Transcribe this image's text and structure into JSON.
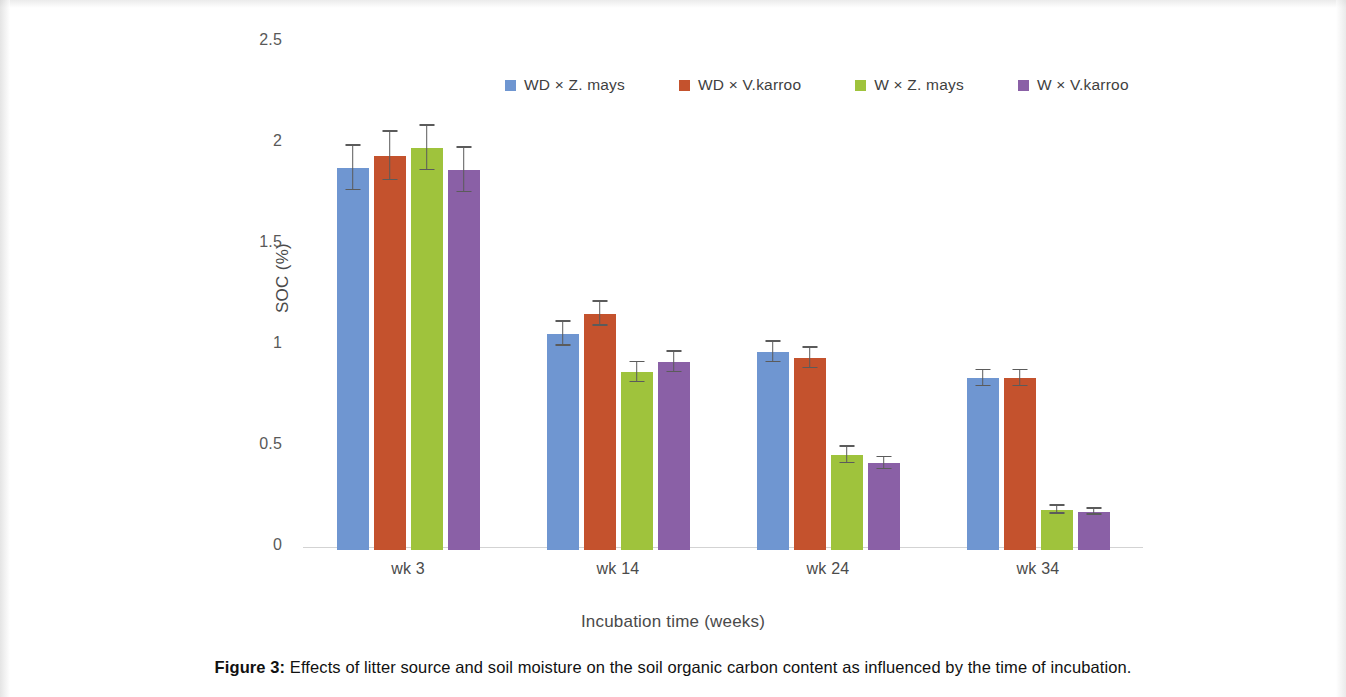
{
  "caption": {
    "label": "Figure 3:",
    "text": " Effects of litter source and soil moisture on the soil organic carbon content as influenced by the time of incubation."
  },
  "chart_data": {
    "type": "bar",
    "title": "",
    "xlabel": "Incubation time (weeks)",
    "ylabel": "SOC (%)",
    "ylim": [
      0,
      2.5
    ],
    "yticks": [
      "0",
      "0.5",
      "1",
      "1.5",
      "2",
      "2.5"
    ],
    "grid": false,
    "legend_position": "top",
    "categories": [
      "wk 3",
      "wk 14",
      "wk 24",
      "wk 34"
    ],
    "series": [
      {
        "name": "WD × Z. mays",
        "color": "#6F96D1",
        "values": [
          1.89,
          1.07,
          0.98,
          0.85
        ],
        "errors": [
          0.11,
          0.06,
          0.05,
          0.04
        ]
      },
      {
        "name": "WD × V.karroo",
        "color": "#C4522D",
        "values": [
          1.95,
          1.17,
          0.95,
          0.85
        ],
        "errors": [
          0.12,
          0.06,
          0.05,
          0.04
        ]
      },
      {
        "name": "W × Z. mays",
        "color": "#9FC33C",
        "values": [
          1.99,
          0.88,
          0.47,
          0.2
        ],
        "errors": [
          0.11,
          0.05,
          0.04,
          0.02
        ]
      },
      {
        "name": "W × V.karroo",
        "color": "#8A60A6",
        "values": [
          1.88,
          0.93,
          0.43,
          0.19
        ],
        "errors": [
          0.11,
          0.05,
          0.03,
          0.015
        ]
      }
    ]
  }
}
